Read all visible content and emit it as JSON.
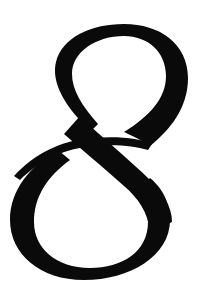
{
  "glyph": {
    "character": "8",
    "style": "italic serif numeral",
    "color": "#0a0a0a",
    "background": "#ffffff"
  }
}
